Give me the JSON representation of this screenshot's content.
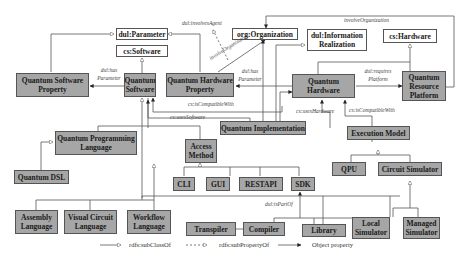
{
  "nodes": {
    "dul_parameter": "dul:Parameter",
    "cs_software": "cs:Software",
    "org_organization": "org:Organization",
    "dul_information_realization": "dul:Information Realization",
    "cs_hardware": "cs:Hardware",
    "quantum_software_property": "Quantum Software Property",
    "quantum_software": "Quantum Software",
    "quantum_hardware_property": "Quantum Hardware Property",
    "quantum_hardware": "Quantum Hardware",
    "quantum_resource_platform": "Quantum Resource Platform",
    "quantum_implementation": "Quantum Implementation",
    "quantum_programming_language": "Quantum Programming Language",
    "quantum_dsl": "Quantum DSL",
    "access_method": "Access Method",
    "cli": "CLI",
    "gui": "GUI",
    "restapi": "RESTAPI",
    "sdk": "SDK",
    "execution_model": "Execution Model",
    "qpu": "QPU",
    "circuit_simulator": "Circuit Simulator",
    "assembly_language": "Assembly Language",
    "visual_circuit_language": "Visual Circuit Language",
    "workflow_language": "Workflow Language",
    "transpiler": "Transpiler",
    "compiler": "Compiler",
    "library": "Library",
    "local_simulator": "Local Simulator",
    "managed_simulator": "Managed Simulator"
  },
  "edge_labels": {
    "involves_agent": "dul:involvesAgent",
    "involves_organization_diag": "involveOrganization",
    "involves_organization_top": "involveOrganization",
    "has_parameter_sw": "dul:has Parameter",
    "has_parameter_hw": "dul:has Parameter",
    "requires_platform": "dul:requires Platform",
    "is_compatible_with_sw": "cs:isCompatibleWith",
    "uses_software": "cs:usesSoftware",
    "uses_hardware": "cs:usesHardware",
    "is_compatible_with_hw": "cs:isCompatibleWith",
    "is_part_of": "dul:isPartOf"
  },
  "legend": {
    "subclass": "rdfs:subClassOf",
    "subproperty": "rdfs:subPropertyOf",
    "object_property": "Object property"
  },
  "colors": {
    "core_fill": "#a6a6a6",
    "external_fill": "#ffffff",
    "line": "#555555"
  }
}
